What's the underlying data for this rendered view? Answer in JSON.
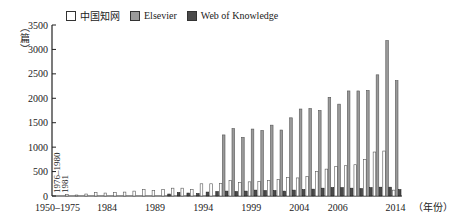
{
  "chart_data": {
    "type": "bar",
    "title": "",
    "xlabel": "（年份）",
    "ylabel": "（篇）",
    "ylim": [
      0,
      3500
    ],
    "yticks": [
      0,
      500,
      1000,
      1500,
      2000,
      2500,
      3000,
      3500
    ],
    "grid": false,
    "legend_position": "top",
    "categories": [
      "1950–1975",
      "1976–1980",
      "1981",
      "1982",
      "1983",
      "1984",
      "1985",
      "1986",
      "1987",
      "1988",
      "1989",
      "1990",
      "1991",
      "1992",
      "1993",
      "1994",
      "1995",
      "1996",
      "1997",
      "1998",
      "1999",
      "2000",
      "2001",
      "2002",
      "2003",
      "2004",
      "2005",
      "2006",
      "2007",
      "2008",
      "2009",
      "2010",
      "2011",
      "2012",
      "2013",
      "2014"
    ],
    "x_tick_labels": [
      "1950–1975",
      "1984",
      "1989",
      "1994",
      "1999",
      "2004",
      "2006",
      "2014"
    ],
    "rotated_annotations": [
      "1976–1980",
      "1981"
    ],
    "series": [
      {
        "name": "中国知网",
        "color": "#ffffff",
        "values": [
          0,
          30,
          20,
          40,
          70,
          60,
          70,
          80,
          100,
          130,
          110,
          130,
          160,
          160,
          130,
          250,
          250,
          260,
          320,
          280,
          290,
          300,
          320,
          340,
          380,
          370,
          400,
          500,
          550,
          600,
          620,
          640,
          750,
          900,
          920,
          120
        ]
      },
      {
        "name": "Elsevier",
        "color": "#9a9a9a",
        "values": [
          0,
          0,
          0,
          0,
          0,
          0,
          0,
          0,
          0,
          0,
          0,
          0,
          0,
          0,
          0,
          0,
          0,
          1250,
          1380,
          1200,
          1370,
          1340,
          1450,
          1350,
          1600,
          1780,
          1790,
          1750,
          2020,
          1880,
          2150,
          2150,
          2160,
          2480,
          3180,
          2360
        ]
      },
      {
        "name": "Web of Knowledge",
        "color": "#4a4a4a",
        "values": [
          0,
          0,
          0,
          0,
          0,
          0,
          0,
          0,
          0,
          0,
          0,
          40,
          70,
          60,
          50,
          80,
          90,
          100,
          90,
          100,
          120,
          110,
          110,
          100,
          120,
          130,
          140,
          160,
          170,
          170,
          160,
          150,
          170,
          180,
          180,
          130
        ]
      }
    ]
  },
  "legend": {
    "items": [
      {
        "label": "中国知网",
        "color": "#ffffff"
      },
      {
        "label": "Elsevier",
        "color": "#9a9a9a"
      },
      {
        "label": "Web of Knowledge",
        "color": "#4a4a4a"
      }
    ]
  },
  "axis": {
    "ylabel": "（篇）",
    "xlabel": "（年份）"
  }
}
